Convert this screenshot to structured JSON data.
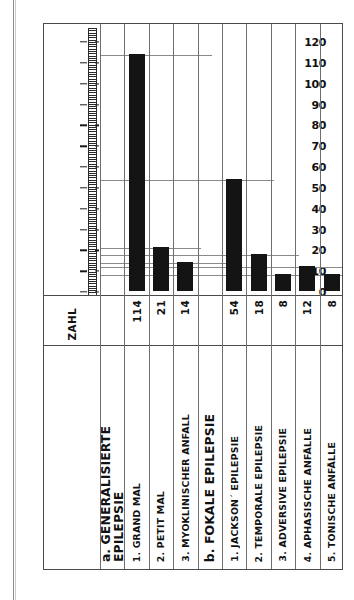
{
  "chart_data": {
    "type": "bar",
    "title": "",
    "xlabel": "",
    "ylabel": "ZAHL",
    "ylim": [
      0,
      120
    ],
    "grid": true,
    "legend": false,
    "value_header": "ZAHL",
    "y_ticks": [
      0,
      10,
      20,
      30,
      40,
      50,
      60,
      70,
      80,
      90,
      100,
      110,
      120
    ],
    "y_tick_labels": [
      "0",
      "10",
      "20",
      "30",
      "40",
      "50",
      "60",
      "70",
      "80",
      "90",
      "100",
      "110",
      "120"
    ],
    "groups": [
      {
        "label_line1": "a. GENERALISIERTE",
        "label_line2": "EPILEPSIE",
        "label": "a. GENERALISIERTE EPILEPSIE"
      },
      {
        "label_line1": "b. FOKALE EPILEPSIE",
        "label_line2": "",
        "label": "b. FOKALE EPILEPSIE"
      }
    ],
    "categories": [
      "1. GRAND MAL",
      "2. PETIT MAL",
      "3. MYOKLINISCHER ANFALL",
      "1. JACKSON´ EPILEPSIE",
      "2. TEMPORALE  EPILEPSIE",
      "3. ADVERSIVE  EPILEPSIE",
      "4. APHASISCHE ANFÄLLE",
      "5. TONISCHE ANFÄLLE"
    ],
    "values": [
      114,
      21,
      14,
      54,
      18,
      8,
      12,
      8
    ],
    "value_labels": [
      "114",
      "21",
      "14",
      "54",
      "18",
      "8",
      "12",
      "8"
    ],
    "colors": {
      "bar": "#141414",
      "frame": "#4a4a4a",
      "grid": "#8a8a8a",
      "background": "#ffffff"
    }
  },
  "columns": [
    {
      "kind": "axis",
      "name": "ZAHL",
      "value": "ZAHL",
      "group": true
    },
    {
      "kind": "group",
      "name": "a. GENERALISIERTE",
      "name2": "EPILEPSIE",
      "value": ""
    },
    {
      "kind": "bar",
      "name": "1. GRAND MAL",
      "value": "114"
    },
    {
      "kind": "bar",
      "name": "2. PETIT MAL",
      "value": "21"
    },
    {
      "kind": "bar",
      "name": "3. MYOKLINISCHER ANFALL",
      "value": "14"
    },
    {
      "kind": "group",
      "name": "b. FOKALE EPILEPSIE",
      "name2": "",
      "value": ""
    },
    {
      "kind": "bar",
      "name": "1. JACKSON´ EPILEPSIE",
      "value": "54"
    },
    {
      "kind": "bar",
      "name": "2. TEMPORALE  EPILEPSIE",
      "value": "18"
    },
    {
      "kind": "bar",
      "name": "3. ADVERSIVE  EPILEPSIE",
      "value": "8"
    },
    {
      "kind": "bar",
      "name": "4. APHASISCHE ANFÄLLE",
      "value": "12"
    },
    {
      "kind": "bar",
      "name": "5. TONISCHE ANFÄLLE",
      "value": "8"
    }
  ]
}
